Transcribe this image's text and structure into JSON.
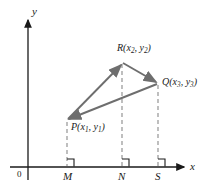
{
  "figure": {
    "background_color": "#ffffff",
    "axis_color": "#1a1a1a",
    "shape_color": "#6e6e6e",
    "dash_color": "#8a8a8a",
    "width": 209,
    "height": 192
  },
  "axes": {
    "x_label": "x",
    "y_label": "y",
    "origin_label": "0",
    "x_axis_y": 167,
    "y_axis_x": 28,
    "x_axis_start": 10,
    "x_axis_end": 186,
    "y_axis_top": 18,
    "y_axis_bottom": 180
  },
  "points": [
    {
      "id": "P",
      "name": "P",
      "label_main": "P",
      "sub1": "1",
      "sub2": "1",
      "x": 67,
      "y": 120,
      "label_x": 72,
      "label_y": 124
    },
    {
      "id": "R",
      "name": "R",
      "label_main": "R",
      "sub1": "2",
      "sub2": "2",
      "x": 122,
      "y": 62,
      "label_x": 118,
      "label_y": 44
    },
    {
      "id": "Q",
      "name": "Q",
      "label_main": "Q",
      "sub1": "3",
      "sub2": "3",
      "x": 158,
      "y": 83,
      "label_x": 163,
      "label_y": 78
    }
  ],
  "point_labels": {
    "P": "P(x1, y1)",
    "R": "R(x2, y2)",
    "Q": "Q(x3, y3)"
  },
  "feet": [
    {
      "id": "M",
      "label": "M",
      "x": 67,
      "label_x": 63,
      "label_y": 172
    },
    {
      "id": "N",
      "label": "N",
      "x": 122,
      "label_x": 118,
      "label_y": 172
    },
    {
      "id": "S",
      "label": "S",
      "x": 158,
      "label_x": 155,
      "label_y": 172
    }
  ],
  "triangle": {
    "vertices": "P,R,Q",
    "edges": [
      {
        "from": "P",
        "to": "R"
      },
      {
        "from": "R",
        "to": "Q"
      },
      {
        "from": "Q",
        "to": "P"
      }
    ]
  },
  "right_angle_marks": [
    {
      "at": "M",
      "x": 67
    },
    {
      "at": "N",
      "x": 122
    },
    {
      "at": "S",
      "x": 158
    }
  ]
}
